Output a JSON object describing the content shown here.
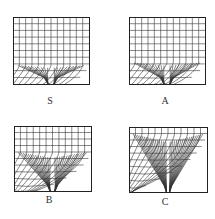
{
  "figure": {
    "panels": [
      {
        "id": "S",
        "label": "S",
        "description": "mesh with slight deformation near bottom orifice"
      },
      {
        "id": "A",
        "label": "A",
        "description": "mesh with moderate curving flow lines near bottom orifice"
      },
      {
        "id": "B",
        "label": "B",
        "description": "mesh with strong funnel-shaped convergence toward bottom orifice"
      },
      {
        "id": "C",
        "label": "C",
        "description": "mesh with radial fan lines converging toward bottom orifice"
      }
    ],
    "grid": {
      "columns": 12,
      "rows": 10
    },
    "colors": {
      "line": "#333333",
      "background": "#ffffff"
    }
  }
}
